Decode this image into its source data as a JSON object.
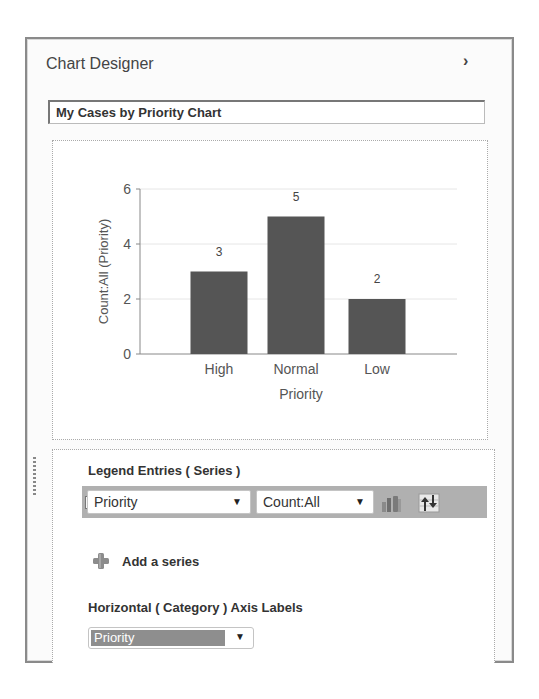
{
  "panel": {
    "title": "Chart Designer",
    "collapse_icon": "chevron-right-icon",
    "collapse_glyph": "›"
  },
  "chart_title_input": {
    "value": "My Cases by Priority Chart"
  },
  "chart_data": {
    "type": "bar",
    "title": "",
    "categories": [
      "High",
      "Normal",
      "Low"
    ],
    "values": [
      3,
      5,
      2
    ],
    "data_labels": [
      "3",
      "5",
      "2"
    ],
    "xlabel": "Priority",
    "ylabel": "Count:All (Priority)",
    "yticks": [
      "0",
      "2",
      "4",
      "6"
    ],
    "ylim": [
      0,
      6
    ],
    "grid": true,
    "legend": "none",
    "bar_color": "#555555"
  },
  "legend_entries": {
    "heading": "Legend Entries ( Series )",
    "series": [
      {
        "checked": true,
        "check_glyph": "✓",
        "field": "Priority",
        "aggregate": "Count:All",
        "chart_type_icon": "bar-chart-type-icon",
        "sort_icon": "sort-order-icon"
      }
    ],
    "dropdown_arrow": "▼",
    "add_series_label": "Add a series",
    "add_series_icon": "plus-icon"
  },
  "category_axis": {
    "heading": "Horizontal ( Category ) Axis Labels",
    "selected": "Priority",
    "dropdown_arrow": "▼"
  },
  "colors": {
    "series_row_bg": "#b0b0b0",
    "bar": "#555555",
    "selected_category_bg": "#8e8e8e"
  }
}
